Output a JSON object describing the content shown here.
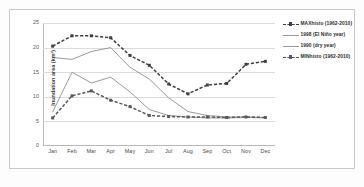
{
  "chart_data": {
    "type": "line",
    "title": "",
    "xlabel": "",
    "ylabel": "Inundation area (km²)",
    "categories": [
      "Jan",
      "Feb",
      "Mar",
      "Apr",
      "May",
      "Jun",
      "Jul",
      "Aug",
      "Sep",
      "Oct",
      "Nov",
      "Dec"
    ],
    "ylim": [
      0,
      25
    ],
    "yticks": [
      0,
      5,
      10,
      15,
      20,
      25
    ],
    "grid": true,
    "legend_position": "right",
    "series": [
      {
        "name": "MAXhisto (1962-2010)",
        "color": "#3f3f3f",
        "style": "dashed",
        "marker": "square",
        "values": [
          20.3,
          22.4,
          22.4,
          22.0,
          18.4,
          16.4,
          12.6,
          10.6,
          12.4,
          12.7,
          16.6,
          17.2
        ]
      },
      {
        "name": "1998 (El Niño year)",
        "color": "#9b9b9b",
        "style": "solid",
        "marker": "none",
        "values": [
          18.0,
          17.6,
          19.2,
          20.0,
          16.0,
          13.6,
          9.8,
          7.0,
          6.2,
          5.9,
          5.9,
          5.8
        ]
      },
      {
        "name": "1990 (dry year)",
        "color": "#9b9b9b",
        "style": "solid",
        "marker": "none",
        "values": [
          6.9,
          15.0,
          12.8,
          14.0,
          11.0,
          7.4,
          6.2,
          5.9,
          5.7,
          5.7,
          5.8,
          5.7
        ]
      },
      {
        "name": "MINhisto (1962-2010)",
        "color": "#5a5a5a",
        "style": "dashed",
        "marker": "square",
        "values": [
          5.7,
          10.2,
          11.2,
          9.3,
          8.0,
          6.2,
          6.0,
          5.9,
          5.9,
          5.8,
          5.9,
          5.8
        ]
      }
    ]
  }
}
